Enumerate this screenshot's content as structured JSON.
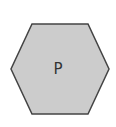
{
  "diagram": {
    "shape": "hexagon",
    "label": "P",
    "fill": "#cccccc",
    "stroke": "#444444",
    "points": "32,24 88,24 109,69 88,114 32,114 11,69",
    "label_x": 58,
    "label_y": 74
  }
}
